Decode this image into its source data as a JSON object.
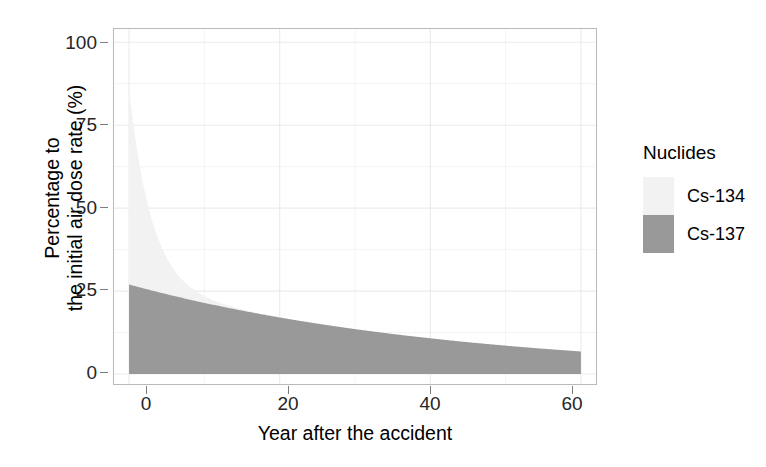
{
  "chart_data": {
    "type": "area",
    "stacked": true,
    "title": "",
    "xlabel": "Year after the accident",
    "ylabel": "Percentage to\nthe initial air dose rate (%)",
    "ylabel_lines": [
      "Percentage to",
      "the initial air dose rate (%)"
    ],
    "xlim": [
      -2,
      62
    ],
    "ylim": [
      -3,
      104
    ],
    "xticks": [
      0,
      20,
      40,
      60
    ],
    "xticklabels": [
      "0",
      "20",
      "40",
      "60"
    ],
    "yticks": [
      0,
      25,
      50,
      75,
      100
    ],
    "yticklabels": [
      "0",
      "25",
      "50",
      "75",
      "100"
    ],
    "grid": true,
    "minor_grid": true,
    "grid_color": "#ebebeb",
    "panel_border_color": "#b9b9b9",
    "background": "#ffffff",
    "legend": {
      "title": "Nuclides",
      "position": "right",
      "entries": [
        {
          "name": "Cs-134",
          "color": "#f2f2f2"
        },
        {
          "name": "Cs-137",
          "color": "#999999"
        }
      ]
    },
    "series": [
      {
        "name": "Cs-137",
        "color": "#999999",
        "half_life_years": 30.17,
        "initial_percent": 27.0,
        "x": [
          0,
          5,
          10,
          15,
          20,
          25,
          30,
          35,
          40,
          45,
          50,
          55,
          60
        ],
        "values": [
          27.0,
          24.1,
          21.5,
          19.2,
          17.1,
          15.3,
          13.6,
          12.2,
          10.9,
          9.7,
          8.7,
          7.7,
          6.9
        ]
      },
      {
        "name": "Cs-134",
        "color": "#f2f2f2",
        "half_life_years": 2.06,
        "initial_percent": 59.0,
        "x": [
          0,
          1,
          2,
          3,
          4,
          5,
          6,
          8,
          10,
          12,
          15,
          20,
          25,
          30,
          40,
          50,
          60
        ],
        "values": [
          59.0,
          42.2,
          30.2,
          21.6,
          15.5,
          11.1,
          7.9,
          4.1,
          2.1,
          1.1,
          0.4,
          0.1,
          0.0,
          0.0,
          0.0,
          0.0,
          0.0
        ]
      }
    ],
    "total_at_zero_percent": 86.0
  }
}
